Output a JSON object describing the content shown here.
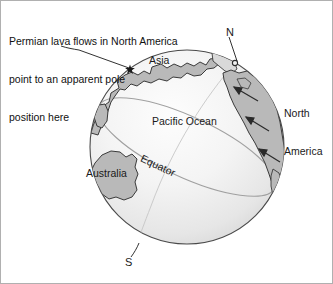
{
  "figure": {
    "type": "diagram",
    "caption": {
      "line1": "Permian lava flows in North America",
      "line2": "point to an apparent pole",
      "line3": "position here"
    },
    "labels": {
      "asia": "Asia",
      "pacific_ocean": "Pacific Ocean",
      "australia": "Australia",
      "north_america": "North\nAmerica",
      "north_america_line1": "North",
      "north_america_line2": "America",
      "north_pole": "N",
      "south_pole": "S",
      "equator": "Equator"
    },
    "colors": {
      "landmass_fill": "#b9b9b9",
      "landmass_stroke": "#333333",
      "ocean_light": "#fbfbfb",
      "ocean_mid": "#eeeeee",
      "ocean_dark": "#d8d8d8",
      "globe_outline": "#4a4a4a",
      "equator_line": "#9a9a9a",
      "leader_line": "#1a1a1a",
      "text": "#111111",
      "frame": "#b0b0b0"
    },
    "globe": {
      "center_x": 186,
      "center_y": 146,
      "radius": 97
    },
    "markers": {
      "apparent_pole_star": {
        "x": 129,
        "y": 68,
        "name": "star-marker"
      },
      "north_pole_dot": {
        "x": 234,
        "y": 62,
        "name": "pole-dot"
      }
    },
    "arrows": {
      "count": 3,
      "direction": "northwest",
      "meaning": "Permian lava flow magnetization directions"
    }
  }
}
